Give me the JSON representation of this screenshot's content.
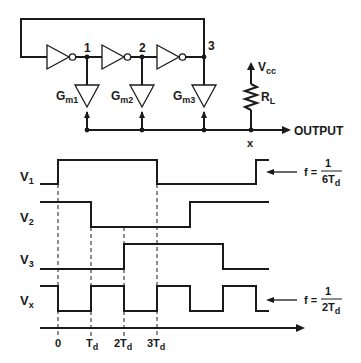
{
  "circuit": {
    "nodes": [
      "1",
      "2",
      "3"
    ],
    "transconductors": [
      {
        "label": "G",
        "sub": "m1"
      },
      {
        "label": "G",
        "sub": "m2"
      },
      {
        "label": "G",
        "sub": "m3"
      }
    ],
    "supply": {
      "label": "V",
      "sub": "cc"
    },
    "load": {
      "label": "R",
      "sub": "L"
    },
    "output_label": "OUTPUT",
    "output_node": "x"
  },
  "waveforms": {
    "signals": [
      {
        "label": "V",
        "sub": "1"
      },
      {
        "label": "V",
        "sub": "2"
      },
      {
        "label": "V",
        "sub": "3"
      },
      {
        "label": "V",
        "sub": "x"
      }
    ],
    "time_ticks": [
      {
        "main": "0",
        "sub": ""
      },
      {
        "main": "T",
        "sub": "d"
      },
      {
        "main": "2T",
        "sub": "d"
      },
      {
        "main": "3T",
        "sub": "d"
      }
    ],
    "annotations": [
      {
        "prefix": "f =",
        "num": "1",
        "den": "6T",
        "den_sub": "d"
      },
      {
        "prefix": "f =",
        "num": "1",
        "den": "2T",
        "den_sub": "d"
      }
    ]
  }
}
